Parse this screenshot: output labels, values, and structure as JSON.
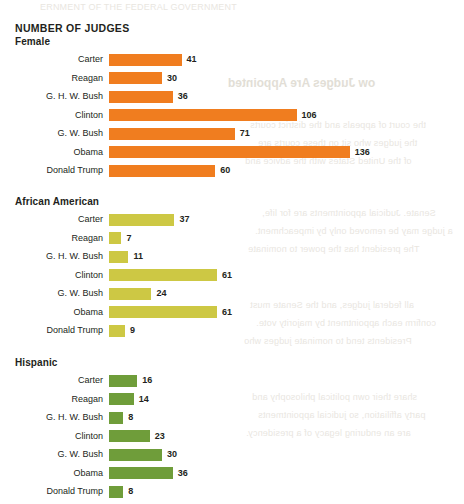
{
  "title": "NUMBER OF JUDGES",
  "ghost_title": "ow Judges Are Appointed",
  "ghost_header": "ERNMENT OF THE FEDERAL GOVERNMENT",
  "ghost_lines": [
    "the court of appeals and the district courts",
    "the judges who sit on these courts are",
    "of the United States with the advice and",
    "Senate. Judicial appointments are for life,",
    "a judge may be removed only by impeachment.",
    "The president has the power to nominate",
    "all federal judges, and the Senate must",
    "confirm each appointment by majority vote.",
    "Presidents tend to nominate judges who",
    "share their own political philosophy and",
    "party affiliation, so judicial appointments",
    "are an enduring legacy of a presidency."
  ],
  "chart_data": {
    "type": "bar",
    "title": "NUMBER OF JUDGES",
    "orientation": "horizontal",
    "xlabel": "",
    "ylabel": "",
    "axis_visible": false,
    "grid": false,
    "legend": "none",
    "max_value": 136,
    "categories": [
      "Carter",
      "Reagan",
      "G. H. W. Bush",
      "Clinton",
      "G. W. Bush",
      "Obama",
      "Donald Trump"
    ],
    "groups": [
      {
        "label": "Female",
        "color": "#f07d1f",
        "values": [
          41,
          30,
          36,
          106,
          71,
          136,
          60
        ]
      },
      {
        "label": "African American",
        "color": "#c9c councils"
      }
    ]
  },
  "panels": [
    {
      "label": "Female",
      "color": "#f07d1f",
      "rows": [
        {
          "name": "Carter",
          "value": 41
        },
        {
          "name": "Reagan",
          "value": 30
        },
        {
          "name": "G. H. W. Bush",
          "value": 36
        },
        {
          "name": "Clinton",
          "value": 106
        },
        {
          "name": "G. W. Bush",
          "value": 71
        },
        {
          "name": "Obama",
          "value": 136
        },
        {
          "name": "Donald Trump",
          "value": 60
        }
      ]
    },
    {
      "label": "African American",
      "color": "#cdc844",
      "rows": [
        {
          "name": "Carter",
          "value": 37
        },
        {
          "name": "Reagan",
          "value": 7
        },
        {
          "name": "G. H. W. Bush",
          "value": 11
        },
        {
          "name": "Clinton",
          "value": 61
        },
        {
          "name": "G. W. Bush",
          "value": 24
        },
        {
          "name": "Obama",
          "value": 61
        },
        {
          "name": "Donald Trump",
          "value": 9
        }
      ]
    },
    {
      "label": "Hispanic",
      "color": "#6f9d3a",
      "rows": [
        {
          "name": "Carter",
          "value": 16
        },
        {
          "name": "Reagan",
          "value": 14
        },
        {
          "name": "G. H. W. Bush",
          "value": 8
        },
        {
          "name": "Clinton",
          "value": 23
        },
        {
          "name": "G. W. Bush",
          "value": 30
        },
        {
          "name": "Obama",
          "value": 36
        },
        {
          "name": "Donald Trump",
          "value": 8
        }
      ]
    }
  ]
}
